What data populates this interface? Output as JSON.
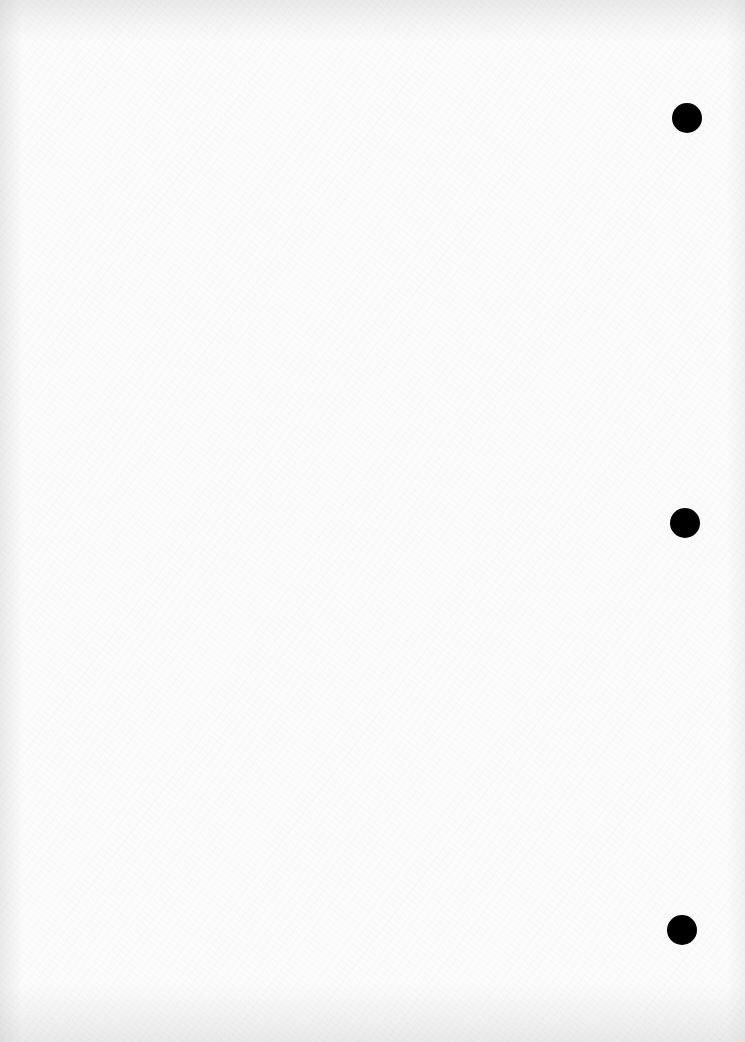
{
  "page": {
    "type": "blank-paper-scan",
    "background_color": "#fbfbfb",
    "text": ""
  },
  "binder_holes": [
    {
      "cx": 687,
      "cy": 118,
      "diameter": 30,
      "color": "#000000"
    },
    {
      "cx": 685,
      "cy": 523,
      "diameter": 30,
      "color": "#000000"
    },
    {
      "cx": 682,
      "cy": 930,
      "diameter": 30,
      "color": "#000000"
    }
  ]
}
